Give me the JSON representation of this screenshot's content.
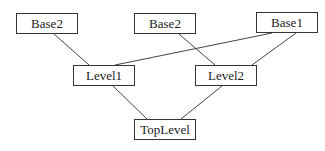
{
  "diagram": {
    "type": "class-inheritance-hierarchy",
    "nodes": [
      {
        "id": "base2_left",
        "label": "Base2",
        "x": 16,
        "y": 13,
        "w": 62,
        "h": 21
      },
      {
        "id": "base2_mid",
        "label": "Base2",
        "x": 134,
        "y": 13,
        "w": 62,
        "h": 21
      },
      {
        "id": "base1",
        "label": "Base1",
        "x": 256,
        "y": 12,
        "w": 62,
        "h": 21
      },
      {
        "id": "level1",
        "label": "Level1",
        "x": 73,
        "y": 65,
        "w": 62,
        "h": 21
      },
      {
        "id": "level2",
        "label": "Level2",
        "x": 195,
        "y": 65,
        "w": 62,
        "h": 21
      },
      {
        "id": "toplevel",
        "label": "TopLevel",
        "x": 134,
        "y": 119,
        "w": 62,
        "h": 21
      }
    ],
    "edges": [
      {
        "from": "base2_left",
        "to": "level1",
        "x1": 54,
        "y1": 34,
        "x2": 89,
        "y2": 65
      },
      {
        "from": "base1",
        "to": "level1",
        "x1": 272,
        "y1": 33,
        "x2": 115,
        "y2": 65
      },
      {
        "from": "base2_mid",
        "to": "level2",
        "x1": 179,
        "y1": 34,
        "x2": 215,
        "y2": 65
      },
      {
        "from": "base1",
        "to": "level2",
        "x1": 296,
        "y1": 33,
        "x2": 252,
        "y2": 65
      },
      {
        "from": "level1",
        "to": "toplevel",
        "x1": 113,
        "y1": 86,
        "x2": 147,
        "y2": 119
      },
      {
        "from": "level2",
        "to": "toplevel",
        "x1": 222,
        "y1": 86,
        "x2": 181,
        "y2": 119
      }
    ]
  }
}
